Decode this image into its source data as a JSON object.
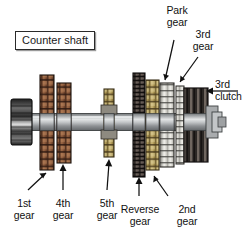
{
  "figure": {
    "title_box": "Counter shaft",
    "background": "#ffffff",
    "colors": {
      "shaft": "#b9bbbd",
      "shaft_dark": "#6e7173",
      "hub_dark": "#303030",
      "gear_copper": "#8c5a3c",
      "gear_khaki": "#b9a366",
      "gear_light": "#e8e6e0",
      "gear_dark": "#3a3330",
      "outline": "#1a1a1a",
      "label_text": "#111111"
    }
  },
  "labels": {
    "park_gear": "Park\ngear",
    "third_gear": "3rd\ngear",
    "third_clutch": "3rd\nclutch",
    "first_gear": "1st\ngear",
    "fourth_gear": "4th\ngear",
    "fifth_gear": "5th\ngear",
    "reverse_gear": "Reverse\ngear",
    "second_gear": "2nd\ngear"
  },
  "components": [
    {
      "name": "splined-hub",
      "type": "hub",
      "color": "#303030"
    },
    {
      "name": "first-gear",
      "type": "gear",
      "color": "#8c5a3c"
    },
    {
      "name": "fourth-gear",
      "type": "gear",
      "color": "#8c5a3c"
    },
    {
      "name": "fifth-gear",
      "type": "gear",
      "color": "#b9a366"
    },
    {
      "name": "reverse-gear",
      "type": "gear",
      "color": "#3a3330"
    },
    {
      "name": "second-gear",
      "type": "gear",
      "color": "#b9a366"
    },
    {
      "name": "park-gear",
      "type": "gear",
      "color": "#e8e6e0"
    },
    {
      "name": "third-gear",
      "type": "gear",
      "color": "#3a3330"
    },
    {
      "name": "third-clutch",
      "type": "clutch",
      "color": "#3a3330"
    }
  ]
}
